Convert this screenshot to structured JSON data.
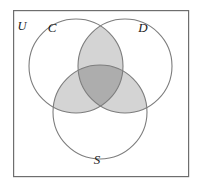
{
  "figure": {
    "type": "venn-diagram-3-set",
    "background_color": "#ffffff"
  },
  "frame": {
    "label": "U",
    "label_name": "universal-set-label",
    "x": 13,
    "y": 10,
    "width": 176,
    "height": 167,
    "stroke_color": "#6e6e6e",
    "stroke_width": 1.2,
    "fill_color": "#ffffff"
  },
  "sets": [
    {
      "id": "C",
      "label": "C",
      "cx": 76,
      "cy": 66,
      "r": 47,
      "label_x": 52,
      "label_y": 32
    },
    {
      "id": "D",
      "label": "D",
      "cx": 125,
      "cy": 66,
      "r": 47,
      "label_x": 143,
      "label_y": 32
    },
    {
      "id": "S",
      "label": "S",
      "cx": 100,
      "cy": 112,
      "r": 47,
      "label_x": 97,
      "label_y": 163
    }
  ],
  "style": {
    "circle_stroke_color": "#7d7d7d",
    "circle_stroke_width": 1.1,
    "circle_fill": "none",
    "pairwise_shade_color": "#d4d4d4",
    "triple_shade_color": "#adadad",
    "unshaded_color": "#ffffff"
  },
  "shaded_regions": [
    {
      "name": "C-and-D",
      "sets": [
        "C",
        "D"
      ],
      "shade": "pairwise",
      "color": "#d4d4d4"
    },
    {
      "name": "C-and-S",
      "sets": [
        "C",
        "S"
      ],
      "shade": "pairwise",
      "color": "#d4d4d4"
    },
    {
      "name": "D-and-S",
      "sets": [
        "D",
        "S"
      ],
      "shade": "pairwise",
      "color": "#d4d4d4"
    },
    {
      "name": "C-and-D-and-S",
      "sets": [
        "C",
        "D",
        "S"
      ],
      "shade": "triple",
      "color": "#adadad"
    }
  ],
  "unshaded_regions": [
    {
      "name": "C-only",
      "sets": [
        "C"
      ]
    },
    {
      "name": "D-only",
      "sets": [
        "D"
      ]
    },
    {
      "name": "S-only",
      "sets": [
        "S"
      ]
    },
    {
      "name": "outside-all-sets",
      "sets": []
    }
  ]
}
